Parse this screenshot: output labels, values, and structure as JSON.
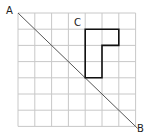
{
  "diagram": {
    "grid": {
      "cols": 7,
      "rows": 7,
      "x0": 18,
      "y0": 13,
      "cell_w": 16.8,
      "cell_h": 16.2,
      "line_color": "#c8c8c8"
    },
    "line_ab": {
      "from_label": "A",
      "to_label": "B",
      "color": "#555555"
    },
    "shape": {
      "label": "C",
      "type": "L-shaped polygon",
      "grid_vertices": [
        [
          4,
          1
        ],
        [
          6,
          1
        ],
        [
          6,
          2
        ],
        [
          5,
          2
        ],
        [
          5,
          4
        ],
        [
          4,
          4
        ]
      ],
      "color": "#111111"
    },
    "labels": {
      "a": "A",
      "b": "B",
      "c": "C"
    }
  }
}
